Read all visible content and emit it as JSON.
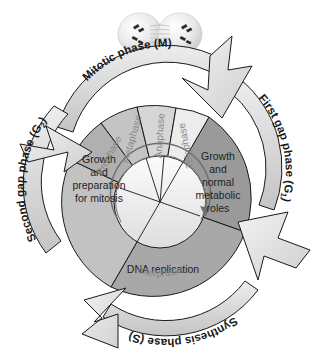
{
  "figure": {
    "caption_partial": ""
  },
  "illustration": {
    "name": "dividing-cell",
    "description": "Two dividing daughter cells with chromosomes and spindle fibers"
  },
  "outer_ring": {
    "phases": [
      {
        "id": "m",
        "label": "Mitotic phase (M)",
        "color": "#d8d8d8"
      },
      {
        "id": "g1",
        "label": "First gap phase (G",
        "sub": "1",
        "tail": ")",
        "color": "#d8d8d8"
      },
      {
        "id": "s",
        "label": "Synthesis phase (S)",
        "color": "#d8d8d8"
      },
      {
        "id": "g2",
        "label": "Second gap phase (G",
        "sub": "2",
        "tail": ")",
        "color": "#d8d8d8"
      }
    ]
  },
  "sectors": [
    {
      "id": "g1",
      "lines": [
        "Growth",
        "and",
        "normal",
        "metabolic",
        "roles"
      ],
      "color": "#9a9a9a"
    },
    {
      "id": "s",
      "lines": [
        "DNA replication"
      ],
      "color": "#a8a8a8"
    },
    {
      "id": "g2",
      "lines": [
        "Growth",
        "and",
        "preparation",
        "for mitosis"
      ],
      "color": "#c2c2c2"
    }
  ],
  "mitotic_wedges": [
    {
      "id": "prophase",
      "label": "Prophase",
      "color": "#b0b0b0"
    },
    {
      "id": "metaphase",
      "label": "Metaphase",
      "color": "#c4c4c4"
    },
    {
      "id": "anaphase",
      "label": "Anaphase",
      "color": "#d6d6d6"
    },
    {
      "id": "telophase",
      "label": "Telophase",
      "color": "#ececec"
    }
  ],
  "inner_ring": {
    "label": "Interphase",
    "color": "#b8b8b8"
  },
  "arrows": {
    "count": 4,
    "direction": "clockwise",
    "color": "#dcdcdc",
    "names": [
      "arrow-m-to-g1",
      "arrow-g1-to-s",
      "arrow-s-to-g2",
      "arrow-g2-to-m"
    ]
  },
  "colors": {
    "stroke": "#1a1a1a",
    "text": "#222222",
    "wedge_text": "#8a8a8a",
    "background": "#ffffff"
  }
}
